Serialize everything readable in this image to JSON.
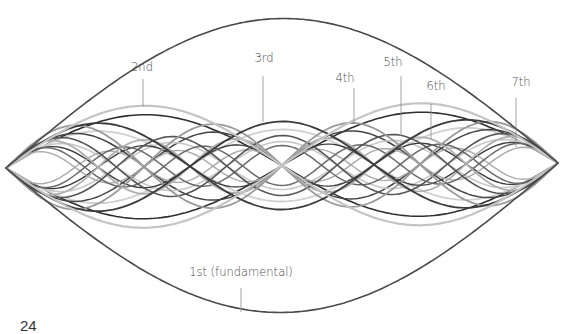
{
  "diagram": {
    "nodes": {
      "left": [
        6,
        168
      ],
      "right": [
        558,
        163
      ]
    },
    "midline_y": 166,
    "harmonics": [
      {
        "n": 1,
        "label": "1st (fundamental)",
        "amplitude": 147,
        "color": "#4a4a4a",
        "width": 1.6,
        "label_pos": [
          241,
          276
        ],
        "leader": [
          241,
          288,
          241,
          312
        ]
      },
      {
        "n": 2,
        "label": "2nd",
        "amplitude": 61,
        "color": "#c4c4c4",
        "width": 2.2,
        "label_pos": [
          142,
          71
        ],
        "leader": [
          143,
          79,
          143,
          106
        ]
      },
      {
        "n": 3,
        "label": "3rd",
        "amplitude": 44,
        "color": "#3a3a3a",
        "width": 1.8,
        "label_pos": [
          264,
          62
        ],
        "leader": [
          263,
          76,
          263,
          122
        ]
      },
      {
        "n": 4,
        "label": "4th",
        "amplitude": 42,
        "color": "#9a9a9a",
        "width": 1.8,
        "label_pos": [
          345,
          82
        ],
        "leader": [
          354,
          88,
          354,
          124
        ]
      },
      {
        "n": 5,
        "label": "5th",
        "amplitude": 30,
        "color": "#555555",
        "width": 1.6,
        "label_pos": [
          393,
          66
        ],
        "leader": [
          401,
          76,
          401,
          136
        ]
      },
      {
        "n": 6,
        "label": "6th",
        "amplitude": 27,
        "color": "#b0b0b0",
        "width": 1.8,
        "label_pos": [
          436,
          90
        ],
        "leader": [
          431,
          104,
          431,
          139
        ]
      },
      {
        "n": 7,
        "label": "7th",
        "amplitude": 20,
        "color": "#6a6a6a",
        "width": 1.5,
        "label_pos": [
          521,
          86
        ],
        "leader": [
          516,
          98,
          516,
          147
        ]
      }
    ],
    "extra_curves": [
      {
        "n": 2,
        "amplitude": 52,
        "color": "#2f2f2f",
        "width": 1.6
      },
      {
        "n": 3,
        "amplitude": 36,
        "color": "#d0d0d0",
        "width": 1.8
      },
      {
        "n": 4,
        "amplitude": 34,
        "color": "#444444",
        "width": 1.5
      },
      {
        "n": 5,
        "amplitude": 24,
        "color": "#c8c8c8",
        "width": 1.6
      },
      {
        "n": 6,
        "amplitude": 21,
        "color": "#3c3c3c",
        "width": 1.4
      },
      {
        "n": 8,
        "amplitude": 16,
        "color": "#aaaaaa",
        "width": 1.4
      }
    ]
  },
  "page": {
    "number": "24"
  }
}
